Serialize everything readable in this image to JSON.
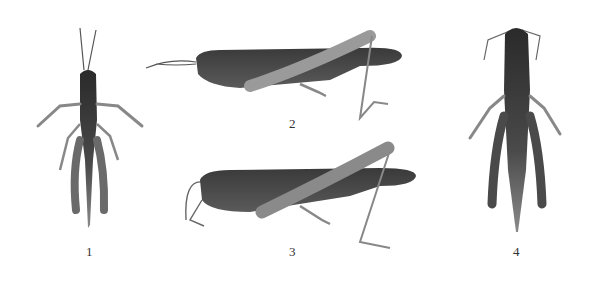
{
  "plate": {
    "background": "#ffffff",
    "figures": [
      {
        "number": "1",
        "view": "dorsal",
        "subject": "grasshopper"
      },
      {
        "number": "2",
        "view": "lateral",
        "subject": "grasshopper"
      },
      {
        "number": "3",
        "view": "lateral",
        "subject": "grasshopper"
      },
      {
        "number": "4",
        "view": "dorsal",
        "subject": "grasshopper"
      }
    ]
  }
}
